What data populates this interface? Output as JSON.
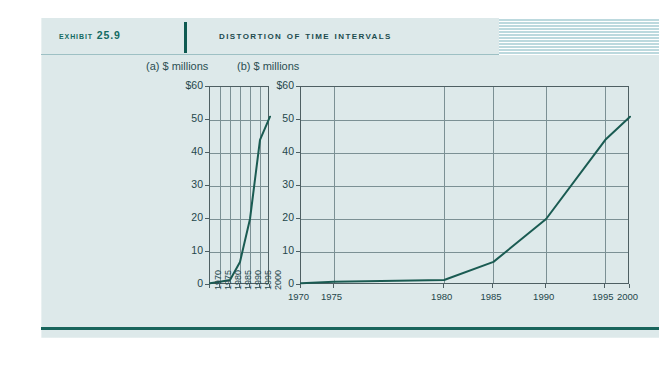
{
  "header": {
    "exhibit_label": "Exhibit 25.9",
    "title": "Distortion of Time Intervals",
    "divider_icon": "vertical-rule-icon",
    "stripe_icon": "striped-decoration-block"
  },
  "colors": {
    "panel_background": "#dde9ea",
    "label_teal": "#146b63",
    "title_teal": "#1c4c4f",
    "series_line": "#1a5b52",
    "grid": "#7b9094",
    "axis": "#4e5f63",
    "bottom_rule": "#19655c",
    "stripe_block": "#c3dee2"
  },
  "chart_data": [
    {
      "type": "line",
      "panel": "a",
      "title": "(a) $ millions",
      "xlabel": "",
      "ylabel": "$ millions",
      "grid": true,
      "legend": "none",
      "ylim": [
        0,
        60
      ],
      "ytick_labels": [
        "$60",
        "50",
        "40",
        "30",
        "20",
        "10",
        "0"
      ],
      "ytick_values": [
        60,
        50,
        40,
        30,
        20,
        10,
        0
      ],
      "x_axis_kind": "equal-intervals",
      "x": [
        1970,
        1975,
        1980,
        1985,
        1990,
        1995,
        2000
      ],
      "xtick_labels": [
        "1970",
        "1975",
        "1980",
        "1985",
        "1990",
        "1995",
        "2000"
      ],
      "values": [
        0.5,
        1,
        1.5,
        7,
        20,
        44,
        51
      ]
    },
    {
      "type": "line",
      "panel": "b",
      "title": "(b) $ millions",
      "xlabel": "",
      "ylabel": "$ millions",
      "grid": true,
      "legend": "none",
      "ylim": [
        0,
        60
      ],
      "ytick_labels": [
        "$60",
        "50",
        "40",
        "30",
        "20",
        "10",
        "0"
      ],
      "ytick_values": [
        60,
        50,
        40,
        30,
        20,
        10,
        0
      ],
      "x_axis_kind": "unequal-distorted-intervals",
      "x": [
        1970,
        1975,
        1980,
        1985,
        1990,
        1995,
        2000
      ],
      "xtick_labels": [
        "1970",
        "1975",
        "1980",
        "1985",
        "1990",
        "1995",
        "2000"
      ],
      "x_pixel_fractions": [
        0.0,
        0.1,
        0.435,
        0.585,
        0.745,
        0.925,
        1.0
      ],
      "values": [
        0.5,
        1,
        1.5,
        7,
        20,
        44,
        51
      ]
    }
  ]
}
